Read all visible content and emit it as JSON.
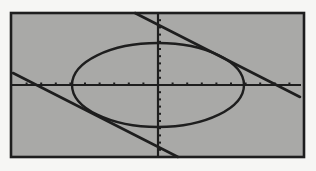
{
  "screen": {
    "background": "#a9a9a7",
    "frame_color": "#1e1e1e",
    "page_background": "#f6f6f4",
    "window": {
      "x": 11,
      "y": 13,
      "width": 293,
      "height": 144
    }
  },
  "axes": {
    "origin": {
      "x": 158,
      "y": 85
    },
    "x_tick_spacing": 14.6,
    "y_tick_spacing": 7.2,
    "color": "#1e1e1e"
  },
  "chart_data": {
    "type": "line",
    "title": "",
    "xlabel": "",
    "ylabel": "",
    "grid": false,
    "legend": null,
    "xlim": [
      -10,
      10
    ],
    "ylim": [
      -10,
      10
    ],
    "series": [
      {
        "name": "ellipse",
        "shape": "ellipse",
        "center": [
          0,
          0
        ],
        "semi_axis_x": 5.9,
        "semi_axis_y": 5.8,
        "pixel": {
          "cx": 158,
          "cy": 85,
          "rx": 86,
          "ry": 42
        }
      },
      {
        "name": "upper-tangent-line",
        "shape": "line",
        "pixel": {
          "x1": 135,
          "y1": 13,
          "x2": 300,
          "y2": 97
        }
      },
      {
        "name": "lower-tangent-line",
        "shape": "line",
        "pixel": {
          "x1": 13,
          "y1": 73,
          "x2": 178,
          "y2": 157
        }
      }
    ]
  }
}
